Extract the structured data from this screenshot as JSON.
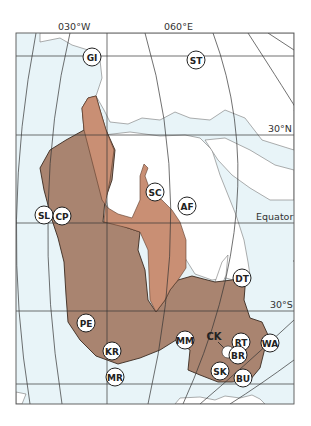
{
  "map": {
    "axis_labels": {
      "lon_west": "030°W",
      "lon_east": "060°E",
      "lat_north": "30°N",
      "equator": "Equator",
      "lat_south": "30°S"
    },
    "colors": {
      "ocean": "#e8f4f8",
      "land": "#ffffff",
      "craton_dark": "#a98470",
      "craton_light": "#c98f74",
      "grid": "#333333",
      "coast": "#666666"
    },
    "sites": [
      {
        "code": "GI",
        "x": 92,
        "y": 57
      },
      {
        "code": "ST",
        "x": 196,
        "y": 60
      },
      {
        "code": "SC",
        "x": 155,
        "y": 192
      },
      {
        "code": "AF",
        "x": 187,
        "y": 206
      },
      {
        "code": "SL",
        "x": 44,
        "y": 215
      },
      {
        "code": "CP",
        "x": 62,
        "y": 216
      },
      {
        "code": "DT",
        "x": 242,
        "y": 278
      },
      {
        "code": "PE",
        "x": 86,
        "y": 323
      },
      {
        "code": "KR",
        "x": 112,
        "y": 351
      },
      {
        "code": "MR",
        "x": 115,
        "y": 377
      },
      {
        "code": "MM",
        "x": 185,
        "y": 340
      },
      {
        "code": "RT",
        "x": 241,
        "y": 342
      },
      {
        "code": "WA",
        "x": 270,
        "y": 343
      },
      {
        "code": "BR",
        "x": 238,
        "y": 355
      },
      {
        "code": "SK",
        "x": 220,
        "y": 371
      },
      {
        "code": "BU",
        "x": 243,
        "y": 378
      }
    ],
    "unlabeled_label": {
      "code": "CK",
      "x": 214,
      "y": 337
    }
  }
}
